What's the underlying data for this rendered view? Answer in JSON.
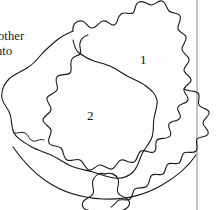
{
  "figure": {
    "kind": "line-diagram",
    "background_color": "#fdfdfc",
    "ink_color": "#1a1a1a",
    "stroke_width": 1
  },
  "body_text": {
    "line_1": "other",
    "line_2": "nto"
  },
  "labels": {
    "region_1": "1",
    "region_2": "2"
  },
  "rule": {
    "name": "vertical-rule",
    "x": 197,
    "color": "#8d8d8d"
  },
  "shapes": {
    "outer_crenulated_contour": "M 72 33 C 76 26 84 24 90 27 C 95 29 97 34 101 33 C 105 32 104 26 109 24 C 114 22 118 27 122 25 C 126 23 124 16 129 13 C 134 10 139 14 142 12 C 145 10 144 4 149 3 C 154 2 157 8 160 9 C 164 10 167 5 171 7 C 175 9 174 15 177 18 C 180 21 186 19 188 23 C 190 27 185 32 186 37 C 187 42 193 43 194 48 C 195 53 189 56 189 61 C 189 66 195 68 196 72 C 197 77 191 79 190 84 C 189 89 195 92 194 96 C 193 101 186 100 184 104 C 182 108 188 112 186 116 C 184 120 177 118 175 122 C 173 126 179 131 176 135 C 173 139 166 136 163 139 C 160 142 164 149 160 152 C 156 155 150 150 146 152 C 142 154 143 161 139 163 C 135 165 130 160 126 161 C 122 162 121 169 117 170 C 113 171 109 166 105 166 C 101 166 98 172 94 171 C 90 170 89 163 85 161 C 81 159 76 163 72 161 C 68 159 69 152 66 149 C 63 146 56 148 54 144 C 52 140 57 135 56 131 C 55 127 48 125 48 120 C 48 115 54 113 55 109 C 56 105 50 101 51 96 C 52 91 59 91 61 87 C 63 83 58 78 61 74 C 64 70 71 73 74 70 C 77 67 73 60 76 56 C 79 52 86 55 89 52 C 92 49 88 42 91 39 C 94 36 100 40 103 38",
    "inner_smooth_contour": "M 30 74 C 36 66 45 60 56 57 C 67 54 76 57 84 62 C 92 67 96 76 104 79 C 112 82 120 77 128 80 C 136 83 140 92 141 101 C 142 110 138 118 139 127 C 140 136 146 143 143 151 C 140 159 130 161 121 164 C 112 167 104 173 95 173 C 86 173 79 167 70 165 C 61 163 51 165 43 161 C 35 157 30 148 26 140 C 22 132 17 125 16 116 C 15 107 19 99 21 91 C 23 83 25 80 30 74",
    "bottom_arc": "M 14 148 C 40 178 82 196 124 196 C 156 196 180 184 196 166"
  }
}
